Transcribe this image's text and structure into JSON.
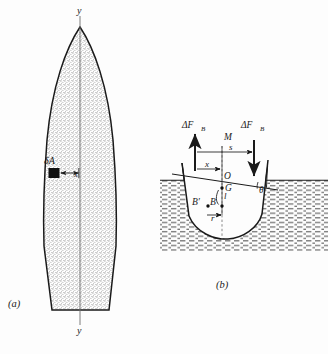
{
  "figure": {
    "background_color": "#fdfdfd",
    "ink_color": "#1a1a1a",
    "panels": [
      {
        "id": "a",
        "label": "(a)",
        "description": "waterplane-area-plan-view",
        "fill_color": "#d8d8d8",
        "labels": {
          "axis_top": "y",
          "axis_bottom": "y",
          "area_element": "δA",
          "offset": "x"
        }
      },
      {
        "id": "b",
        "label": "(b)",
        "description": "heeled-hull-cross-section",
        "water_color": "#8c8c8c",
        "hull_fill": "#fdfdfd",
        "labels": {
          "force_left": "ΔF",
          "force_left_sub": "B",
          "force_right": "ΔF",
          "force_right_sub": "B",
          "metacenter": "M",
          "separation": "s",
          "offset": "x",
          "origin": "O",
          "center_of_gravity": "G",
          "buoyancy_new": "B′",
          "buoyancy_old": "B",
          "lever": "l",
          "shift": "r",
          "heel_angle": "θ"
        }
      }
    ]
  }
}
